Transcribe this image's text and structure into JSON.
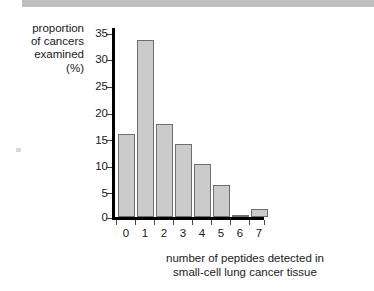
{
  "chart_data": {
    "type": "bar",
    "title": "",
    "xlabel": "number of peptides detected in\nsmall-cell lung cancer tissue",
    "ylabel": "proportion\nof cancers\nexamined\n(%)",
    "categories": [
      "0",
      "1",
      "2",
      "3",
      "4",
      "5",
      "6",
      "7"
    ],
    "values": [
      16,
      34.2,
      18,
      14.1,
      10.2,
      6.2,
      0.2,
      1.5
    ],
    "ylim": [
      0,
      36.5
    ],
    "yticks": [
      0,
      5,
      10,
      15,
      20,
      25,
      30,
      35
    ],
    "ytick_labels": [
      "0",
      "5",
      "10",
      "15",
      "20",
      "25",
      "30",
      "35"
    ],
    "grid": false,
    "legend": false,
    "bar_fill": "#cbcbcb",
    "bar_stroke": "#6e6e6e",
    "axis_color": "#000000"
  },
  "figure": {
    "background": "#ffffff",
    "top_strip_color": "#bfbfbf"
  }
}
